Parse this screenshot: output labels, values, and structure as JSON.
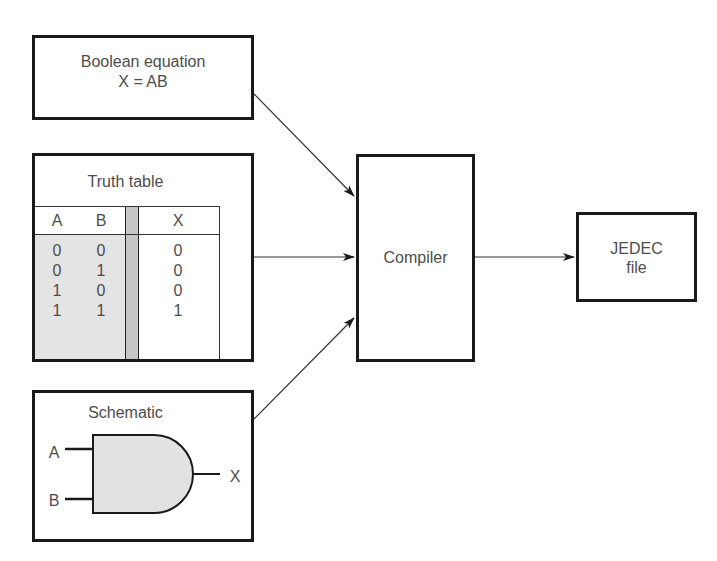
{
  "diagram": {
    "title": "",
    "inputs": {
      "boolean_equation": {
        "title": "Boolean equation",
        "expression": "X = AB"
      },
      "truth_table": {
        "title": "Truth table",
        "headers": [
          "A",
          "B",
          "X"
        ],
        "rows": [
          [
            "0",
            "0",
            "0"
          ],
          [
            "0",
            "1",
            "0"
          ],
          [
            "1",
            "0",
            "0"
          ],
          [
            "1",
            "1",
            "1"
          ]
        ]
      },
      "schematic": {
        "title": "Schematic",
        "gate": "AND",
        "input_a": "A",
        "input_b": "B",
        "output": "X"
      }
    },
    "compiler": {
      "label": "Compiler"
    },
    "output_file": {
      "line1": "JEDEC",
      "line2": "file"
    },
    "edges": [
      {
        "from": "boolean_equation",
        "to": "compiler"
      },
      {
        "from": "truth_table",
        "to": "compiler"
      },
      {
        "from": "schematic",
        "to": "compiler"
      },
      {
        "from": "compiler",
        "to": "output_file"
      }
    ],
    "colors": {
      "stroke": "#1a1a1a",
      "text": "#4d4d4d",
      "shade_light": "#e4e4e4",
      "shade_dark": "#c6c6c6",
      "gate_fill": "#e2e2e2"
    }
  }
}
